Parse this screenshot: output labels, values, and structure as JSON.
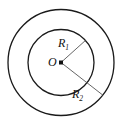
{
  "figure": {
    "type": "annulus-diagram",
    "background_color": "#ffffff",
    "stroke_color": "#1a1a1a",
    "center_label": "O",
    "center_point_marker": "filled-square",
    "circles": [
      {
        "name": "inner-circle",
        "cx": 61,
        "cy": 62.5,
        "r": 33,
        "stroke": "#1a1a1a",
        "stroke_width": 1.3,
        "fill": "none"
      },
      {
        "name": "outer-circle",
        "cx": 61,
        "cy": 62.5,
        "r": 53,
        "stroke": "#1a1a1a",
        "stroke_width": 1.3,
        "fill": "none"
      }
    ],
    "radii": [
      {
        "name": "inner-radius",
        "label_text": "R",
        "label_subscript": "1",
        "x1": 61,
        "y1": 62.5,
        "x2": 85.5,
        "y2": 40.4,
        "stroke": "#555555",
        "stroke_width": 0.9
      },
      {
        "name": "outer-radius",
        "label_text": "R",
        "label_subscript": "2",
        "x1": 61,
        "y1": 62.5,
        "x2": 102.8,
        "y2": 95.1,
        "stroke": "#555555",
        "stroke_width": 0.9
      }
    ],
    "center_dot": {
      "cx": 61,
      "cy": 62.5,
      "size": 4
    }
  }
}
